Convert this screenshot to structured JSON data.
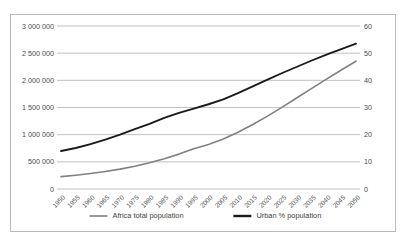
{
  "chart_data": {
    "type": "line",
    "title": "",
    "xlabel": "",
    "ylabel": "",
    "grid": true,
    "legend_position": "bottom",
    "categories": [
      "1950",
      "1955",
      "1960",
      "1965",
      "1970",
      "1975",
      "1980",
      "1985",
      "1990",
      "1995",
      "2000",
      "2005",
      "2010",
      "2015",
      "2020",
      "2025",
      "2030",
      "2035",
      "2040",
      "2045",
      "2050"
    ],
    "left_axis": {
      "label": "",
      "ylim": [
        0,
        3000000
      ],
      "ticks": [
        0,
        500000,
        1000000,
        1500000,
        2000000,
        2500000,
        3000000
      ],
      "tick_labels": [
        "0",
        "500 000",
        "1 000 000",
        "1 500 000",
        "2 000 000",
        "2 500 000",
        "3 000 000"
      ]
    },
    "right_axis": {
      "label": "",
      "ylim": [
        0,
        60
      ],
      "ticks": [
        0,
        10,
        20,
        30,
        40,
        50,
        60
      ],
      "tick_labels": [
        "0",
        "10",
        "20",
        "30",
        "40",
        "50",
        "60"
      ]
    },
    "series": [
      {
        "name": "Africa total population",
        "axis": "left",
        "color": "#808080",
        "width": 1.6,
        "values": [
          228000,
          254000,
          285000,
          322000,
          366000,
          419000,
          482000,
          556000,
          642000,
          740000,
          819000,
          920000,
          1044000,
          1186000,
          1341000,
          1508000,
          1679000,
          1851000,
          2021000,
          2191000,
          2352000
        ]
      },
      {
        "name": "Urban % population",
        "axis": "right",
        "color": "#1a1a1a",
        "width": 1.9,
        "values": [
          14.0,
          15.1,
          16.5,
          18.2,
          20.0,
          22.0,
          24.0,
          26.2,
          28.0,
          29.6,
          31.2,
          33.0,
          35.3,
          37.8,
          40.3,
          42.7,
          45.0,
          47.3,
          49.5,
          51.5,
          53.5
        ]
      }
    ],
    "legend": [
      {
        "label": "Africa total population",
        "color": "#808080",
        "width": 1.6
      },
      {
        "label": "Urban % population",
        "color": "#1a1a1a",
        "width": 2.4
      }
    ]
  }
}
